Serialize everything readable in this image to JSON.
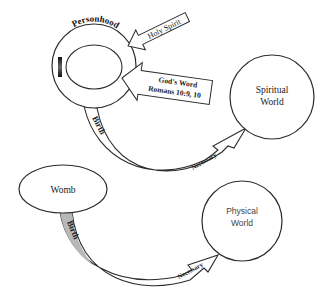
{
  "diagram": {
    "personhood": {
      "ring_label": "Personhood",
      "inner_label": "I"
    },
    "arrows_in": [
      {
        "label": "Holy Spirit"
      },
      {
        "label_line1": "God's Word",
        "label_line2": "Romans 10:9, 10"
      }
    ],
    "spiritual_world": {
      "line1": "Spiritual",
      "line2": "World"
    },
    "womb": {
      "label": "Womb"
    },
    "physical_world": {
      "line1": "Physical",
      "line2": "World"
    },
    "connectors": [
      {
        "from": "Personhood",
        "to": "Spiritual World",
        "start_label": "Birth",
        "end_label": "Necessary"
      },
      {
        "from": "Womb",
        "to": "Physical World",
        "start_label": "Birth",
        "end_label": "Necessary"
      }
    ]
  },
  "colors": {
    "stroke": "#2b2b2b",
    "fill": "#ffffff",
    "gray_band": "#b8b8b8",
    "text": "#222222"
  }
}
